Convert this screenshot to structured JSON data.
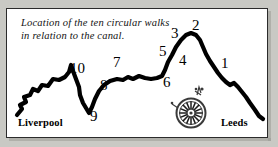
{
  "map": {
    "caption": "Location of the ten circular walks\nin relation to the canal.",
    "cities": {
      "west": "Liverpool",
      "east": "Leeds"
    },
    "compass": {
      "icon": "compass-rose-icon",
      "north_label": "N"
    },
    "walk_labels": [
      {
        "label": "1",
        "x": 214,
        "y": 47
      },
      {
        "label": "2",
        "x": 185,
        "y": 9
      },
      {
        "label": "3",
        "x": 164,
        "y": 17
      },
      {
        "label": "4",
        "x": 172,
        "y": 44
      },
      {
        "label": "5",
        "x": 152,
        "y": 35
      },
      {
        "label": "6",
        "x": 156,
        "y": 66
      },
      {
        "label": "7",
        "x": 106,
        "y": 46
      },
      {
        "label": "8",
        "x": 93,
        "y": 69
      },
      {
        "label": "9",
        "x": 83,
        "y": 100
      },
      {
        "label": "10",
        "x": 63,
        "y": 52
      }
    ],
    "colors": {
      "canal": "#000000",
      "paper": "#ffffff",
      "border": "#2b2b2b",
      "page_background": "#c9c9c4",
      "compass": "#3a3a3a"
    }
  }
}
